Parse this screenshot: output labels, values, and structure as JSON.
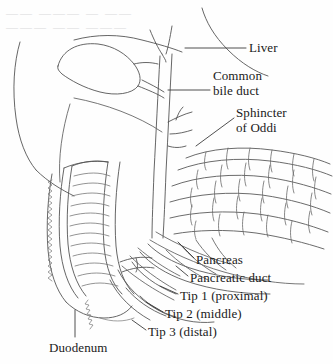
{
  "figure": {
    "width": 333,
    "height": 364,
    "background_color": "#fefefe",
    "ink_color": "#4a4a4a",
    "text_color": "#1a1a1a",
    "style": "pen-and-ink medical line drawing"
  },
  "labels": {
    "liver": "Liver",
    "common_bile_duct_line1": "Common",
    "common_bile_duct_line2": "bile duct",
    "sphincter_line1": "Sphincter",
    "sphincter_line2": "of Oddi",
    "pancreas": "Pancreas",
    "pancreatic_duct": "Pancreatic duct",
    "tip1": "Tip 1 (proximal)",
    "tip2": "Tip 2 (middle)",
    "tip3": "Tip 3 (distal)",
    "duodenum": "Duodenum"
  },
  "structures": [
    {
      "name": "liver",
      "label": "Liver"
    },
    {
      "name": "gallbladder",
      "label": ""
    },
    {
      "name": "cystic-duct",
      "label": ""
    },
    {
      "name": "hepatic-duct",
      "label": ""
    },
    {
      "name": "common-bile-duct",
      "label": "Common bile duct"
    },
    {
      "name": "sphincter-of-oddi",
      "label": "Sphincter of Oddi"
    },
    {
      "name": "pancreas",
      "label": "Pancreas"
    },
    {
      "name": "pancreatic-duct",
      "label": "Pancreatic duct"
    },
    {
      "name": "duodenum",
      "label": "Duodenum"
    }
  ],
  "catheter_tips": [
    {
      "id": "tip-1",
      "label": "Tip 1 (proximal)",
      "position": "proximal"
    },
    {
      "id": "tip-2",
      "label": "Tip 2 (middle)",
      "position": "middle"
    },
    {
      "id": "tip-3",
      "label": "Tip 3 (distal)",
      "position": "distal"
    }
  ],
  "artifacts": {
    "show_bleedthrough": true,
    "bleedthrough_line1": "—— ——— — ——",
    "bleedthrough_line2": "——— —— ———"
  }
}
